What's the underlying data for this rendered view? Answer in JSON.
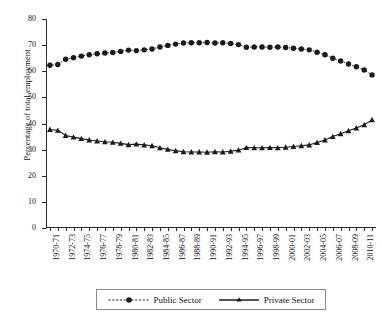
{
  "chart_data": {
    "type": "line",
    "title": "",
    "xlabel": "",
    "ylabel": "Percentage of total employment",
    "ylim": [
      0,
      80
    ],
    "ytick_step": 10,
    "yticks": [
      0,
      10,
      20,
      30,
      40,
      50,
      60,
      70,
      80
    ],
    "grid": false,
    "legend_position": "bottom",
    "categories": [
      "1970-71",
      "1971-72",
      "1972-73",
      "1973-74",
      "1974-75",
      "1975-76",
      "1976-77",
      "1977-78",
      "1978-79",
      "1979-80",
      "1980-81",
      "1981-82",
      "1982-83",
      "1983-84",
      "1984-85",
      "1985-86",
      "1986-87",
      "1987-88",
      "1988-89",
      "1989-90",
      "1990-91",
      "1991-92",
      "1992-93",
      "1993-94",
      "1994-95",
      "1995-96",
      "1996-97",
      "1997-98",
      "1998-99",
      "1999-00",
      "2000-01",
      "2001-02",
      "2002-03",
      "2003-04",
      "2004-05",
      "2005-06",
      "2006-07",
      "2007-08",
      "2008-09",
      "2009-10",
      "2010-11",
      "2011-12"
    ],
    "xtick_labels": [
      "1970-71",
      "1972-73",
      "1974-75",
      "1976-77",
      "1978-79",
      "1980-81",
      "1982-83",
      "1984-85",
      "1986-87",
      "1988-89",
      "1990-91",
      "1992-93",
      "1994-95",
      "1996-97",
      "1998-99",
      "2000-01",
      "2002-03",
      "2004-05",
      "2006-07",
      "2008-09",
      "2010-11"
    ],
    "series": [
      {
        "name": "Public Sector",
        "marker": "circle",
        "linestyle": "dotted",
        "color": "#1a1a1a",
        "values": [
          62.3,
          62.6,
          64.6,
          65.2,
          65.8,
          66.3,
          66.7,
          67.0,
          67.2,
          67.6,
          68.1,
          67.9,
          68.2,
          68.5,
          69.3,
          69.9,
          70.4,
          70.8,
          70.9,
          70.9,
          71.0,
          70.8,
          70.9,
          70.6,
          70.2,
          69.2,
          69.3,
          69.3,
          69.2,
          69.3,
          69.1,
          68.8,
          68.5,
          68.2,
          67.3,
          66.3,
          65.0,
          63.9,
          62.8,
          61.7,
          60.5,
          58.6
        ]
      },
      {
        "name": "Private Sector",
        "marker": "triangle",
        "linestyle": "solid",
        "color": "#1a1a1a",
        "values": [
          37.7,
          37.4,
          35.4,
          34.8,
          34.2,
          33.7,
          33.3,
          33.0,
          32.8,
          32.4,
          31.9,
          32.1,
          31.8,
          31.5,
          30.7,
          30.1,
          29.6,
          29.2,
          29.1,
          29.1,
          29.0,
          29.2,
          29.1,
          29.4,
          29.8,
          30.8,
          30.7,
          30.7,
          30.8,
          30.7,
          30.9,
          31.2,
          31.5,
          31.8,
          32.7,
          33.7,
          35.0,
          36.1,
          37.2,
          38.3,
          39.5,
          41.4
        ]
      }
    ]
  },
  "legend": {
    "items": [
      {
        "label": "Public Sector",
        "marker": "circle-dotted"
      },
      {
        "label": "Private Sector",
        "marker": "triangle-solid"
      }
    ]
  },
  "axis": {
    "y_title": "Percentage of total employment"
  }
}
